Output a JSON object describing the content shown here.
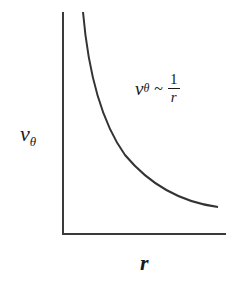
{
  "diagram": {
    "type": "line",
    "y_axis_label": "v",
    "y_axis_label_sub": "θ",
    "x_axis_label": "r",
    "equation": {
      "lhs": "v",
      "lhs_sub": "θ",
      "relation": "~",
      "numerator": "1",
      "denominator": "r"
    },
    "curve_description": "hyperbolic decay v_theta ~ 1/r",
    "colors": {
      "axis": "#3a3a3a",
      "curve": "#333333"
    }
  }
}
